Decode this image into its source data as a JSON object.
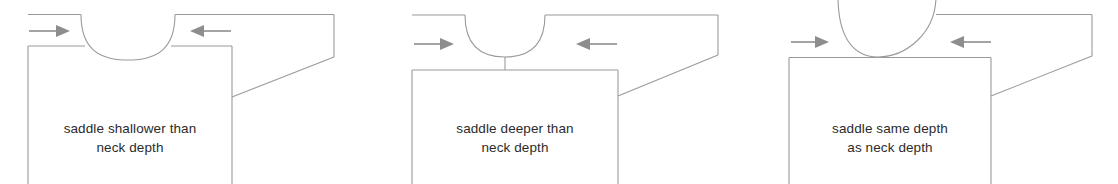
{
  "figure": {
    "background_color": "#ffffff",
    "line_color": "#9a9a9a",
    "arrow_color": "#8d8d8d",
    "text_color": "#2b2b2b"
  },
  "panels": [
    {
      "id": "panel-shallow",
      "caption_line1": "saddle shallower than",
      "caption_line2": "neck depth",
      "left_arrow_direction": "right",
      "right_arrow_direction": "left",
      "saddle_relation": "shallower"
    },
    {
      "id": "panel-deeper",
      "caption_line1": "saddle deeper than",
      "caption_line2": "neck depth",
      "left_arrow_direction": "right",
      "right_arrow_direction": "left",
      "saddle_relation": "deeper"
    },
    {
      "id": "panel-same",
      "caption_line1": "saddle same depth",
      "caption_line2": "as neck depth",
      "left_arrow_direction": "right",
      "right_arrow_direction": "left",
      "saddle_relation": "same"
    }
  ]
}
